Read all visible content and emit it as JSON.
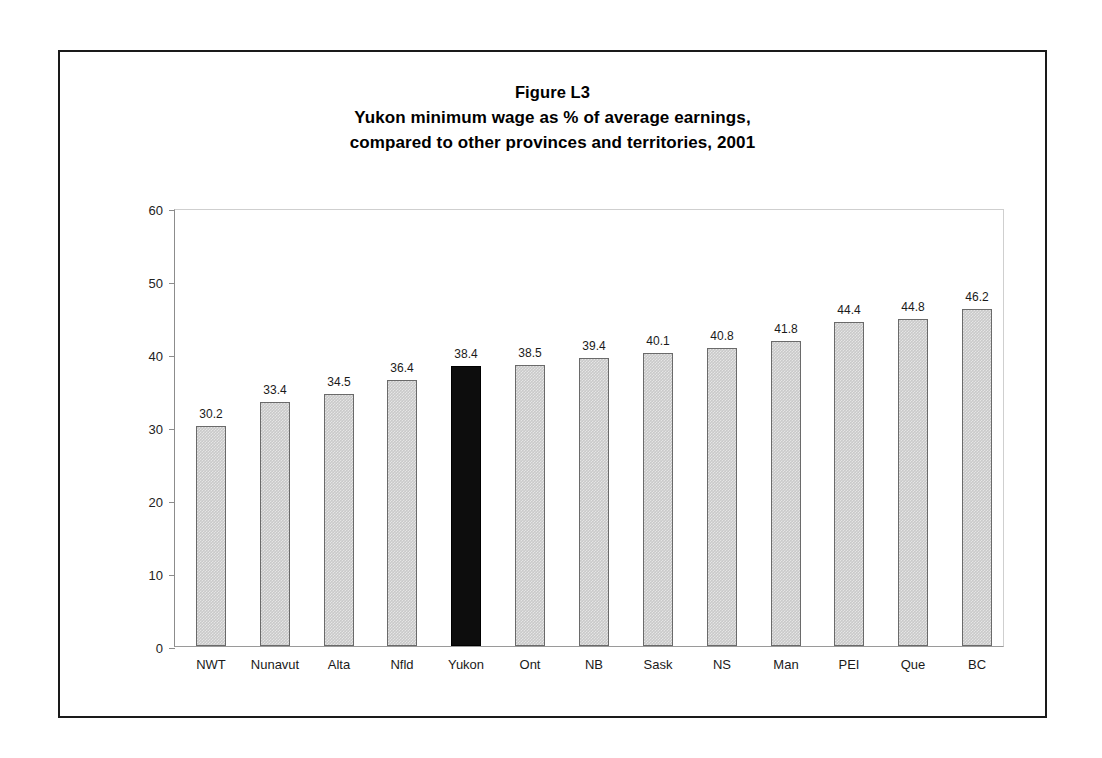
{
  "figure": {
    "title_lines": [
      "Figure L3",
      "Yukon minimum wage as % of average earnings,",
      "compared to other provinces and territories, 2001"
    ]
  },
  "chart_data": {
    "type": "bar",
    "xlabel": "",
    "ylabel": "",
    "ylim": [
      0,
      60
    ],
    "ytick_step": 10,
    "ytick_labels": [
      "60",
      "50",
      "40",
      "30",
      "20",
      "10",
      "0"
    ],
    "grid": false,
    "legend": "none",
    "highlight_category": "Yukon",
    "highlight_color": "#0d0d0d",
    "bar_color": "#c9c9c9",
    "bar_border_color": "#6a6a6a",
    "categories": [
      "NWT",
      "Nunavut",
      "Alta",
      "Nfld",
      "Yukon",
      "Ont",
      "NB",
      "Sask",
      "NS",
      "Man",
      "PEI",
      "Que",
      "BC"
    ],
    "values": [
      30.2,
      33.4,
      34.5,
      36.4,
      38.4,
      38.5,
      39.4,
      40.1,
      40.8,
      41.8,
      44.4,
      44.8,
      46.2
    ],
    "value_labels": [
      "30.2",
      "33.4",
      "34.5",
      "36.4",
      "38.4",
      "38.5",
      "39.4",
      "40.1",
      "40.8",
      "41.8",
      "44.4",
      "44.8",
      "46.2"
    ]
  }
}
